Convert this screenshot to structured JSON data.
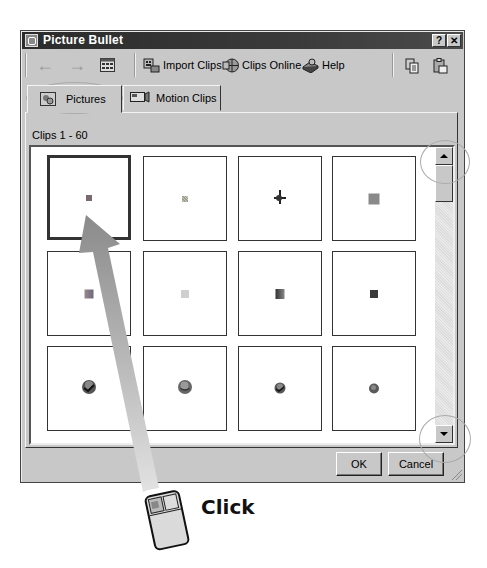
{
  "window": {
    "title": "Picture Bullet",
    "help_button": "?",
    "close_button": "✕"
  },
  "toolbar": {
    "back": "←",
    "forward": "→",
    "import_clips": "Import Clips",
    "clips_online": "Clips Online",
    "help": "Help"
  },
  "tabs": [
    {
      "label": "Pictures",
      "active": true
    },
    {
      "label": "Motion Clips",
      "active": false
    }
  ],
  "clips_range": "Clips 1 - 60",
  "grid": {
    "rows": [
      [
        {
          "glyph": "square-small",
          "color": "#7a6a70",
          "selected": true
        },
        {
          "glyph": "square-speckled",
          "color": "#9aa08a",
          "selected": false
        },
        {
          "glyph": "crosshair-pin",
          "color": "#222222",
          "selected": false
        },
        {
          "glyph": "square",
          "color": "#8a8a8a",
          "selected": false
        }
      ],
      [
        {
          "glyph": "square-gradient",
          "color": "#8a7a88",
          "selected": false
        },
        {
          "glyph": "square-light",
          "color": "#c8c8c8",
          "selected": false
        },
        {
          "glyph": "square-gradient-dark",
          "color": "#555555",
          "selected": false
        },
        {
          "glyph": "square-dark",
          "color": "#3a3a3a",
          "selected": false
        }
      ],
      [
        {
          "glyph": "ball-check",
          "color": "#333333",
          "selected": false
        },
        {
          "glyph": "ball",
          "color": "#666666",
          "selected": false
        },
        {
          "glyph": "ball-check-small",
          "color": "#444444",
          "selected": false
        },
        {
          "glyph": "ball-small",
          "color": "#5a5a5a",
          "selected": false
        }
      ]
    ]
  },
  "buttons": {
    "ok": "OK",
    "cancel": "Cancel"
  },
  "annotation": {
    "label": "Click"
  }
}
